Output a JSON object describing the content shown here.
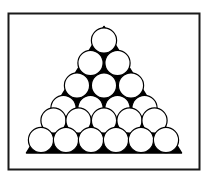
{
  "figure": {
    "canvas": {
      "width": 214,
      "height": 181,
      "background_color": "#ffffff"
    },
    "border": {
      "name": "figure-border",
      "x": 8.5,
      "y": 13.5,
      "width": 191,
      "height": 156,
      "stroke_color": "#1a1a1a",
      "stroke_width": 2,
      "fill_color": "#ffffff"
    },
    "triangle": {
      "name": "black-triangle",
      "fill_color": "#000000",
      "stroke_color": "#000000",
      "stroke_width": 1.5,
      "apex": {
        "x": 104.0,
        "y": 26.5
      },
      "base_left": {
        "x": 26.5,
        "y": 153.0
      },
      "base_right": {
        "x": 181.5,
        "y": 153.0
      },
      "points": "104.0,26.5 181.5,153.0 26.5,153.0"
    },
    "circles": {
      "name": "white-circles",
      "count": 21,
      "fill_color": "#ffffff",
      "stroke_color": "#000000",
      "stroke_width": 1.2,
      "radius": 12.6,
      "rows": [
        {
          "row_index": 1,
          "count": 1,
          "cy": 40.5,
          "items": [
            {
              "label": "circle-r1-c1",
              "cx": 104.0,
              "cy": 40.5
            }
          ]
        },
        {
          "row_index": 2,
          "count": 2,
          "cy": 63.0,
          "items": [
            {
              "label": "circle-r2-c1",
              "cx": 90.5,
              "cy": 63.0
            },
            {
              "label": "circle-r2-c2",
              "cx": 117.5,
              "cy": 63.0
            }
          ]
        },
        {
          "row_index": 3,
          "count": 3,
          "cy": 85.5,
          "items": [
            {
              "label": "circle-r3-c1",
              "cx": 77.0,
              "cy": 85.5
            },
            {
              "label": "circle-r3-c2",
              "cx": 104.0,
              "cy": 85.5
            },
            {
              "label": "circle-r3-c3",
              "cx": 131.0,
              "cy": 85.5
            }
          ]
        },
        {
          "row_index": 4,
          "count": 4,
          "cy": 108.0,
          "items": [
            {
              "label": "circle-r4-c1",
              "cx": 63.5,
              "cy": 108.0
            },
            {
              "label": "circle-r4-c2",
              "cx": 90.5,
              "cy": 108.0
            },
            {
              "label": "circle-r4-c3",
              "cx": 117.5,
              "cy": 108.0
            },
            {
              "label": "circle-r4-c4",
              "cx": 144.5,
              "cy": 108.0
            }
          ]
        },
        {
          "row_index": 5,
          "count": 5,
          "cy": 120.5,
          "items": [
            {
              "label": "circle-r5-c1",
              "cx": 53.5,
              "cy": 120.5
            },
            {
              "label": "circle-r5-c2",
              "cx": 78.5,
              "cy": 120.5
            },
            {
              "label": "circle-r5-c3",
              "cx": 104.0,
              "cy": 120.5
            },
            {
              "label": "circle-r5-c4",
              "cx": 129.5,
              "cy": 120.5
            },
            {
              "label": "circle-r5-c5",
              "cx": 154.5,
              "cy": 120.5
            }
          ]
        },
        {
          "row_index": 6,
          "count": 6,
          "cy": 140.0,
          "items": [
            {
              "label": "circle-r6-c1",
              "cx": 41.0,
              "cy": 140.0
            },
            {
              "label": "circle-r6-c2",
              "cx": 66.0,
              "cy": 140.0
            },
            {
              "label": "circle-r6-c3",
              "cx": 91.0,
              "cy": 140.0
            },
            {
              "label": "circle-r6-c4",
              "cx": 116.0,
              "cy": 140.0
            },
            {
              "label": "circle-r6-c5",
              "cx": 141.0,
              "cy": 140.0
            },
            {
              "label": "circle-r6-c6",
              "cx": 166.0,
              "cy": 140.0
            }
          ]
        }
      ]
    }
  }
}
